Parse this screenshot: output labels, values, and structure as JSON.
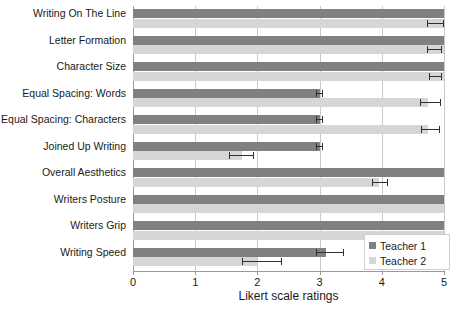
{
  "chart_data": {
    "type": "bar",
    "orientation": "horizontal",
    "title": "",
    "xlabel": "Likert scale ratings",
    "ylabel": "",
    "xlim": [
      0,
      5
    ],
    "xticks": [
      0,
      1,
      2,
      3,
      4,
      5
    ],
    "xticklabels": [
      "0",
      "1",
      "2",
      "3",
      "4",
      "5"
    ],
    "grid": true,
    "grid_axis": "x",
    "legend_position": "lower right",
    "categories": [
      "Writing On The Line",
      "Letter Formation",
      "Character Size",
      "Equal Spacing: Words",
      "Equal Spacing: Characters",
      "Joined Up Writing",
      "Overall Aesthetics",
      "Writers Posture",
      "Writers Grip",
      "Writing Speed"
    ],
    "series": [
      {
        "name": "Teacher 1",
        "color": "#808080",
        "values": [
          5.0,
          5.0,
          5.0,
          3.0,
          3.0,
          3.0,
          5.0,
          5.0,
          5.0,
          3.1
        ],
        "errors_low": [
          5.0,
          5.0,
          5.0,
          2.95,
          2.95,
          2.95,
          5.0,
          5.0,
          5.0,
          2.95
        ],
        "errors_high": [
          5.0,
          5.0,
          5.0,
          3.05,
          3.05,
          3.05,
          5.0,
          5.0,
          5.0,
          3.4
        ]
      },
      {
        "name": "Teacher 2",
        "color": "#d6d6d6",
        "values": [
          5.0,
          5.0,
          5.0,
          4.75,
          4.75,
          1.75,
          3.95,
          5.0,
          5.0,
          2.0
        ],
        "errors_low": [
          4.72,
          4.72,
          4.76,
          4.62,
          4.63,
          1.55,
          3.85,
          5.0,
          5.0,
          1.75
        ],
        "errors_high": [
          5.0,
          4.97,
          4.97,
          4.95,
          4.93,
          1.95,
          4.1,
          5.0,
          5.0,
          2.4
        ]
      }
    ]
  },
  "legend": {
    "items": [
      {
        "label": "Teacher 1"
      },
      {
        "label": "Teacher 2"
      }
    ]
  }
}
